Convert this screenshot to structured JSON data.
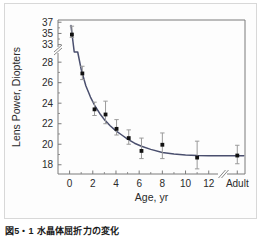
{
  "figure": {
    "caption": "図5・1 水晶体屈折力の変化",
    "background_color": "#ffffff",
    "frame_color": "#d8d8d8"
  },
  "chart_data": {
    "type": "scatter",
    "title": "",
    "subtitle": "",
    "xlabel": "Age,  yr",
    "ylabel": "Lens Power,  Diopters",
    "grid": false,
    "legend": null,
    "line_color": "#4a4f6e",
    "marker_color": "#111111",
    "errorbar_color": "#9a9a9a",
    "axis_color": "#7b7b7b",
    "x_tick_labels": [
      "0",
      "2",
      "4",
      "6",
      "8",
      "10",
      "12",
      "Adult"
    ],
    "x_tick_values": [
      0,
      2,
      4,
      6,
      8,
      10,
      12,
      15
    ],
    "y_tick_labels": [
      "37",
      "35",
      "33",
      "28",
      "26",
      "24",
      "22",
      "20",
      "18"
    ],
    "y_tick_values": [
      37,
      35,
      33,
      28,
      26,
      24,
      22,
      20,
      18
    ],
    "xlim": [
      -1,
      15.6
    ],
    "ylim": [
      17.1,
      37.4
    ],
    "y_axis_break": {
      "present": true,
      "between": [
        33,
        28
      ]
    },
    "x_axis_break": {
      "present": true,
      "between": [
        12.8,
        14.2
      ]
    },
    "points": [
      {
        "x": 0.2,
        "y": 34.8,
        "err_low": 34.3,
        "err_high": 36.3
      },
      {
        "x": 1.1,
        "y": 26.9,
        "err_low": 26.3,
        "err_high": 27.6
      },
      {
        "x": 2.15,
        "y": 23.4,
        "err_low": 22.8,
        "err_high": 24.1
      },
      {
        "x": 3.1,
        "y": 22.9,
        "err_low": 22.0,
        "err_high": 24.2
      },
      {
        "x": 4.05,
        "y": 21.5,
        "err_low": 20.9,
        "err_high": 22.4
      },
      {
        "x": 5.1,
        "y": 20.6,
        "err_low": 20.0,
        "err_high": 21.4
      },
      {
        "x": 6.2,
        "y": 19.35,
        "err_low": 18.6,
        "err_high": 20.6
      },
      {
        "x": 8.0,
        "y": 19.95,
        "err_low": 18.6,
        "err_high": 21.1
      },
      {
        "x": 11.0,
        "y": 18.7,
        "err_low": 17.6,
        "err_high": 20.3
      },
      {
        "x": 15.0,
        "y": 18.9,
        "err_low": 18.1,
        "err_high": 19.9
      }
    ],
    "fit_curve": {
      "description": "decaying exponential fit through lens power data",
      "x": [
        0.12,
        0.4,
        0.7,
        1.0,
        1.4,
        1.8,
        2.2,
        2.6,
        3.0,
        3.5,
        4.0,
        4.5,
        5.0,
        5.6,
        6.2,
        7.0,
        8.0,
        9.0,
        10.0,
        11.0,
        12.0,
        12.8,
        14.2,
        15.5
      ],
      "y": [
        36.4,
        31.6,
        29.0,
        27.3,
        25.7,
        24.6,
        23.7,
        23.0,
        22.4,
        21.8,
        21.3,
        20.9,
        20.5,
        20.1,
        19.8,
        19.5,
        19.2,
        19.05,
        18.95,
        18.9,
        18.88,
        18.87,
        18.87,
        18.87
      ]
    }
  }
}
